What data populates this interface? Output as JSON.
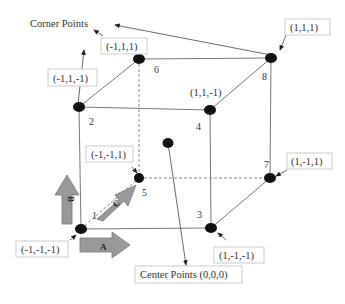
{
  "title_label": "Corner Points",
  "center_label": "Center Points (0,0,0)",
  "corners": [
    {
      "id": "1",
      "coord": "(-1,-1,-1)"
    },
    {
      "id": "2",
      "coord": "(-1,1,-1)"
    },
    {
      "id": "3",
      "coord": "(1,-1,-1)"
    },
    {
      "id": "4",
      "coord": "(1,1,-1)"
    },
    {
      "id": "5",
      "coord": "(-1,-1,1)"
    },
    {
      "id": "6",
      "coord": "(-1,1,1)"
    },
    {
      "id": "7",
      "coord": "(1,-1,1)"
    },
    {
      "id": "8",
      "coord": "(1,1,1)"
    }
  ],
  "axes": {
    "a": "A",
    "b": "B",
    "c": "C"
  },
  "colors": {
    "line": "#666666",
    "dot": "#111111",
    "arrow_fill": "#999999",
    "box_border": "#cccccc"
  }
}
